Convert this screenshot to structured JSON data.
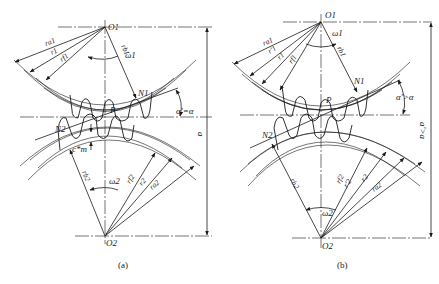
{
  "figure": {
    "panels": [
      {
        "caption": "(a)",
        "labels": {
          "center_top": "O1",
          "center_bottom": "O2",
          "omega_top": "ω1",
          "omega_bottom": "ω2",
          "pitch_point": "P",
          "tangent_top": "N1",
          "tangent_bottom": "N2",
          "pressure_angle": "α'=α",
          "center_distance": "a",
          "clearance": "c*m",
          "radii_top": [
            "ra1",
            "r1",
            "rf1",
            "rb1"
          ],
          "radii_bottom": [
            "rb2",
            "rf2",
            "r2",
            "ra2"
          ]
        }
      },
      {
        "caption": "(b)",
        "labels": {
          "center_top": "O1",
          "center_bottom": "O2",
          "omega_top": "ω1",
          "omega_bottom": "ω2",
          "pitch_point": "P",
          "tangent_top": "N1",
          "tangent_bottom": "N2",
          "pressure_angle": "α'>α",
          "center_distance": "a'>a",
          "radii_top": [
            "ra1",
            "r'1",
            "r1",
            "rf1",
            "rb1"
          ],
          "radii_bottom": [
            "rb2",
            "rf2",
            "r'2",
            "r2",
            "ra2"
          ]
        }
      }
    ]
  }
}
